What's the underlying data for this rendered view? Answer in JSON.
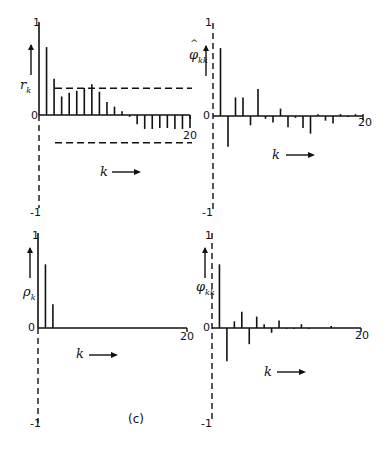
{
  "caption": "(c)",
  "chart_data": [
    {
      "type": "bar",
      "title": "Sample autocorrelation function",
      "ylabel": "r_k",
      "xlabel": "k",
      "x": [
        1,
        2,
        3,
        4,
        5,
        6,
        7,
        8,
        9,
        10,
        11,
        12,
        13,
        14,
        15,
        16,
        17,
        18,
        19,
        20
      ],
      "values": [
        0.73,
        0.39,
        0.2,
        0.24,
        0.26,
        0.29,
        0.33,
        0.25,
        0.14,
        0.09,
        0.04,
        -0.02,
        -0.1,
        -0.15,
        -0.15,
        -0.14,
        -0.14,
        -0.15,
        -0.15,
        -0.14
      ],
      "confidence_limits": [
        0.32,
        -0.32
      ],
      "ylim": [
        -1,
        1
      ],
      "xlim": [
        0,
        20
      ],
      "yticks": [
        "1",
        "0",
        "-1"
      ],
      "xticks": [
        "20"
      ]
    },
    {
      "type": "bar",
      "title": "Sample partial autocorrelation function",
      "ylabel": "φ̂_kk",
      "xlabel": "k",
      "x": [
        1,
        2,
        3,
        4,
        5,
        6,
        7,
        8,
        9,
        10,
        11,
        12,
        13,
        14,
        15,
        16,
        17,
        18,
        19,
        20
      ],
      "values": [
        0.73,
        -0.33,
        0.2,
        0.2,
        -0.1,
        0.29,
        -0.03,
        -0.07,
        0.08,
        -0.12,
        -0.02,
        -0.13,
        -0.19,
        0.02,
        -0.05,
        -0.08,
        0.02,
        -0.01,
        0.02,
        0.02
      ],
      "ylim": [
        -1,
        1
      ],
      "xlim": [
        0,
        20
      ],
      "yticks": [
        "1",
        "0",
        "-1"
      ],
      "xticks": [
        "20"
      ]
    },
    {
      "type": "bar",
      "title": "Theoretical autocorrelation function",
      "ylabel": "ρ_k",
      "xlabel": "k",
      "x": [
        1,
        2
      ],
      "values": [
        0.67,
        0.25
      ],
      "ylim": [
        -1,
        1
      ],
      "xlim": [
        0,
        20
      ],
      "yticks": [
        "1",
        "0",
        "-1"
      ],
      "xticks": [
        "20"
      ]
    },
    {
      "type": "bar",
      "title": "Theoretical partial autocorrelation function",
      "ylabel": "φ_kk",
      "xlabel": "k",
      "x": [
        1,
        2,
        3,
        4,
        5,
        6,
        7,
        8,
        9,
        10,
        11,
        12,
        13,
        14,
        15,
        16
      ],
      "values": [
        0.67,
        -0.35,
        0.07,
        0.17,
        -0.17,
        0.12,
        0.04,
        -0.05,
        0.08,
        -0.01,
        -0.01,
        0.04,
        -0.01,
        0.0,
        0.0,
        0.02
      ],
      "ylim": [
        -1,
        1
      ],
      "xlim": [
        0,
        20
      ],
      "yticks": [
        "1",
        "0",
        "-1"
      ],
      "xticks": [
        "20"
      ]
    }
  ],
  "panels": [
    {
      "ylabel": "r",
      "ysub": "k",
      "hat": false,
      "tick_top": "1",
      "tick_zero": "0",
      "tick_bottom": "-1",
      "tick_x": "20",
      "xlabel": "k"
    },
    {
      "ylabel": "φ",
      "ysub": "kk",
      "hat": true,
      "tick_top": "1",
      "tick_zero": "0",
      "tick_bottom": "-1",
      "tick_x": "20",
      "xlabel": "k"
    },
    {
      "ylabel": "ρ",
      "ysub": "k",
      "hat": false,
      "tick_top": "1",
      "tick_zero": "0",
      "tick_bottom": "-1",
      "tick_x": "20",
      "xlabel": "k"
    },
    {
      "ylabel": "φ",
      "ysub": "kk",
      "hat": false,
      "tick_top": "1",
      "tick_zero": "0",
      "tick_bottom": "-1",
      "tick_x": "20",
      "xlabel": "k"
    }
  ]
}
